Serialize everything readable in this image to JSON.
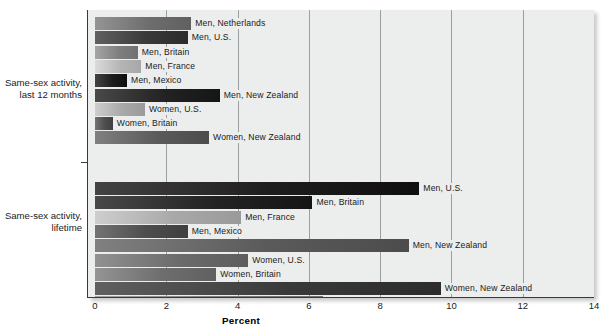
{
  "chart_data": {
    "type": "bar",
    "orientation": "horizontal",
    "title": "",
    "xlabel": "Percent",
    "ylabel": "",
    "xlim": [
      0,
      14
    ],
    "xticks": [
      0,
      2,
      4,
      6,
      8,
      10,
      12,
      14
    ],
    "xtick_labels": [
      "0",
      "2",
      "4",
      "6",
      "8",
      "10",
      "12",
      "14"
    ],
    "grid": "vertical",
    "legend": "none (inline data labels)",
    "groups": [
      {
        "name": "Same-sex activity, last 12 months",
        "label_line1": "Same-sex activity,",
        "label_line2": "last 12 months",
        "categories": [
          "Men, Netherlands",
          "Men, U.S.",
          "Men, Britain",
          "Men, France",
          "Men, Mexico",
          "Men, New Zealand",
          "Women, U.S.",
          "Women, Britain",
          "Women, New Zealand"
        ],
        "values": [
          2.7,
          2.6,
          1.2,
          1.3,
          0.9,
          3.5,
          1.4,
          0.5,
          3.2
        ]
      },
      {
        "name": "Same-sex activity, lifetime",
        "label_line1": "Same-sex activity,",
        "label_line2": "lifetime",
        "categories": [
          "Men, U.S.",
          "Men, Britain",
          "Men, France",
          "Men, Mexico",
          "Men, New Zealand",
          "Women, U.S.",
          "Women, Britain",
          "Women, New Zealand",
          "Men, Australia",
          "Women, Australia"
        ],
        "values": [
          9.1,
          6.1,
          4.1,
          2.6,
          8.8,
          4.3,
          3.4,
          9.7,
          6.4,
          13.5
        ]
      }
    ]
  },
  "style": {
    "plot_background": "#eceded",
    "gridline_color": "#9aa0a2",
    "axis_color": "#3a3a3a",
    "text_color": "#1a1a1a",
    "bar_palette": [
      "#6e6e6e",
      "#4d4d4d",
      "#1d1d1d",
      "#3a3a3a",
      "#5a5a5a",
      "#232323",
      "#7f7f7f",
      "#6b6b6b",
      "#a8a8a8",
      "#b5b5b5"
    ]
  },
  "axis": {
    "title": "Percent"
  }
}
